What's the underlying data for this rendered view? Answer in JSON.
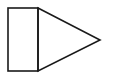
{
  "diagram": {
    "background": "#ffffff",
    "stroke": "#1a1a1a",
    "stroke_width": 1.6,
    "shapes": [
      {
        "type": "rectangle",
        "name": "rectangle",
        "x": 8,
        "y": 8,
        "width": 30,
        "height": 63
      },
      {
        "type": "triangle",
        "name": "triangle",
        "points": "38,8 100,40 38,71"
      }
    ]
  }
}
